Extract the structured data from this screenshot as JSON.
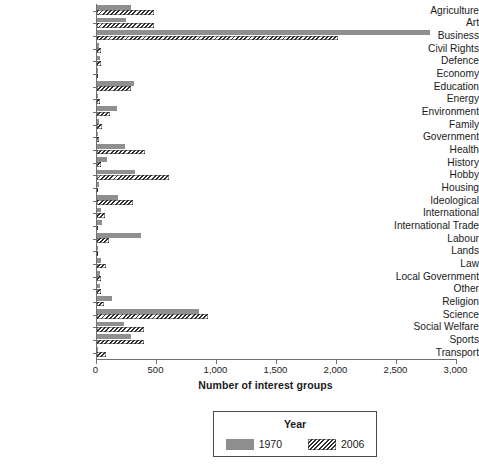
{
  "chart_data": {
    "type": "bar",
    "orientation": "horizontal",
    "title": "",
    "xlabel": "Number of interest groups",
    "ylabel": "",
    "xlim": [
      0,
      3000
    ],
    "xticks": [
      0,
      500,
      1000,
      1500,
      2000,
      2500,
      3000
    ],
    "xticklabels": [
      "0",
      "500",
      "1,000",
      "1,500",
      "2,000",
      "2,500",
      "3,000"
    ],
    "grid": false,
    "legend": {
      "title": "Year",
      "position": "below-axis-centered",
      "entries": [
        {
          "name": "1970",
          "style": "solid-gray",
          "color": "#8f8f8f"
        },
        {
          "name": "2006",
          "style": "diagonal-hatch",
          "color": "#2e2e2e"
        }
      ]
    },
    "categories": [
      "Agriculture",
      "Art",
      "Business",
      "Civil Rights",
      "Defence",
      "Economy",
      "Education",
      "Energy",
      "Environment",
      "Family",
      "Government",
      "Health",
      "History",
      "Hobby",
      "Housing",
      "Ideological",
      "International",
      "International Trade",
      "Labour",
      "Lands",
      "Law",
      "Local Government",
      "Other",
      "Religion",
      "Science",
      "Social Welfare",
      "Sports",
      "Transport"
    ],
    "series": [
      {
        "name": "1970",
        "values": [
          285,
          245,
          2775,
          20,
          25,
          10,
          310,
          15,
          170,
          20,
          15,
          240,
          90,
          320,
          20,
          175,
          35,
          45,
          370,
          5,
          40,
          30,
          25,
          125,
          850,
          225,
          290,
          15
        ]
      },
      {
        "name": "2006",
        "values": [
          480,
          475,
          2015,
          40,
          35,
          15,
          290,
          30,
          115,
          45,
          20,
          400,
          40,
          605,
          15,
          300,
          70,
          10,
          105,
          5,
          80,
          35,
          40,
          60,
          930,
          395,
          395,
          75
        ]
      }
    ]
  }
}
